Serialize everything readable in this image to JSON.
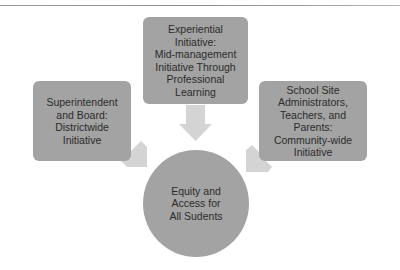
{
  "diagram": {
    "top_node": {
      "label": "Experiential\nInitiative:\nMid-management\nInitiative Through\nProfessional Learning"
    },
    "left_node": {
      "label": "Superintendent\nand Board:\nDistrictwide\nInitiative"
    },
    "right_node": {
      "label": "School Site\nAdministrators,\nTeachers, and Parents:\nCommunity-wide\nInitiative"
    },
    "center_node": {
      "label": "Equity and\nAccess for\nAll Sudents"
    },
    "colors": {
      "node_fill": "#a3a3a3",
      "arrow_fill": "#d4d4d4",
      "text": "#2b2b2b",
      "rule": "#9a9a9a"
    }
  }
}
